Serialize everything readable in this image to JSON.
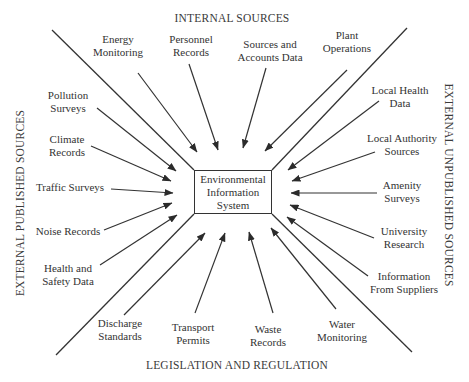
{
  "diagram": {
    "center": {
      "lines": [
        "Environmental",
        "Information",
        "System"
      ],
      "box": {
        "x": 194,
        "y": 170,
        "w": 78,
        "h": 44
      }
    },
    "headings": {
      "top": {
        "text": "INTERNAL SOURCES",
        "x": 232,
        "y": 18
      },
      "bottom": {
        "text": "LEGISLATION AND REGULATION",
        "x": 237,
        "y": 365
      },
      "left": {
        "text": "EXTERNAL PUBLISHED SOURCES",
        "x": 20,
        "y": 203
      },
      "right": {
        "text": "EXTERNAL UNPUBLISHED SOURCES",
        "x": 449,
        "y": 185
      }
    },
    "dividers": [
      {
        "x1": 52,
        "y1": 30,
        "x2": 194,
        "y2": 170
      },
      {
        "x1": 407,
        "y1": 28,
        "x2": 272,
        "y2": 170
      },
      {
        "x1": 194,
        "y1": 214,
        "x2": 56,
        "y2": 355
      },
      {
        "x1": 272,
        "y1": 214,
        "x2": 412,
        "y2": 352
      }
    ],
    "groups": [
      {
        "name": "internal-sources",
        "items": [
          {
            "id": "energy-monitoring",
            "lines": [
              "Energy",
              "Monitoring"
            ],
            "lx": 118,
            "ly": 46,
            "ax1": 138,
            "ay1": 73,
            "ax2": 197,
            "ay2": 152
          },
          {
            "id": "personnel-records",
            "lines": [
              "Personnel",
              "Records"
            ],
            "lx": 191,
            "ly": 46,
            "ax1": 189,
            "ay1": 64,
            "ax2": 218,
            "ay2": 150
          },
          {
            "id": "sources-and-accounts-data",
            "lines": [
              "Sources and",
              "Accounts Data"
            ],
            "lx": 270,
            "ly": 51,
            "ax1": 266,
            "ay1": 68,
            "ax2": 243,
            "ay2": 148
          },
          {
            "id": "plant-operations",
            "lines": [
              "Plant",
              "Operations"
            ],
            "lx": 347,
            "ly": 42,
            "ax1": 347,
            "ay1": 70,
            "ax2": 265,
            "ay2": 151
          }
        ]
      },
      {
        "name": "external-published-sources",
        "items": [
          {
            "id": "pollution-surveys",
            "lines": [
              "Pollution",
              "Surveys"
            ],
            "lx": 68,
            "ly": 102,
            "ax1": 97,
            "ay1": 108,
            "ax2": 176,
            "ay2": 171
          },
          {
            "id": "climate-records",
            "lines": [
              "Climate",
              "Records"
            ],
            "lx": 67,
            "ly": 146,
            "ax1": 91,
            "ay1": 146,
            "ax2": 171,
            "ay2": 181
          },
          {
            "id": "traffic-surveys",
            "lines": [
              "Traffic Surveys"
            ],
            "lx": 70,
            "ly": 187,
            "ax1": 111,
            "ay1": 189,
            "ax2": 173,
            "ay2": 193
          },
          {
            "id": "noise-records",
            "lines": [
              "Noise Records"
            ],
            "lx": 68,
            "ly": 231,
            "ax1": 104,
            "ay1": 230,
            "ax2": 172,
            "ay2": 203
          },
          {
            "id": "health-and-safety-data",
            "lines": [
              "Health and",
              "Safety Data"
            ],
            "lx": 68,
            "ly": 275,
            "ax1": 100,
            "ay1": 265,
            "ax2": 177,
            "ay2": 215
          }
        ]
      },
      {
        "name": "external-unpublished-sources",
        "items": [
          {
            "id": "local-health-data",
            "lines": [
              "Local Health",
              "Data"
            ],
            "lx": 400,
            "ly": 97,
            "ax1": 379,
            "ay1": 101,
            "ax2": 288,
            "ay2": 170
          },
          {
            "id": "local-authority-sources",
            "lines": [
              "Local Authority",
              "Sources"
            ],
            "lx": 402,
            "ly": 145,
            "ax1": 375,
            "ay1": 152,
            "ax2": 292,
            "ay2": 181
          },
          {
            "id": "amenity-surveys",
            "lines": [
              "Amenity",
              "Surveys"
            ],
            "lx": 402,
            "ly": 192,
            "ax1": 377,
            "ay1": 193,
            "ax2": 291,
            "ay2": 193
          },
          {
            "id": "university-research",
            "lines": [
              "University",
              "Research"
            ],
            "lx": 404,
            "ly": 238,
            "ax1": 374,
            "ay1": 238,
            "ax2": 290,
            "ay2": 205
          },
          {
            "id": "information-from-suppliers",
            "lines": [
              "Information",
              "From Suppliers"
            ],
            "lx": 404,
            "ly": 283,
            "ax1": 368,
            "ay1": 276,
            "ax2": 287,
            "ay2": 217
          }
        ]
      },
      {
        "name": "legislation-and-regulation",
        "items": [
          {
            "id": "discharge-standards",
            "lines": [
              "Discharge",
              "Standards"
            ],
            "lx": 120,
            "ly": 330,
            "ax1": 124,
            "ay1": 315,
            "ax2": 205,
            "ay2": 233
          },
          {
            "id": "transport-permits",
            "lines": [
              "Transport",
              "Permits"
            ],
            "lx": 193,
            "ly": 334,
            "ax1": 195,
            "ay1": 313,
            "ax2": 225,
            "ay2": 233
          },
          {
            "id": "waste-records",
            "lines": [
              "Waste",
              "Records"
            ],
            "lx": 268,
            "ly": 336,
            "ax1": 273,
            "ay1": 313,
            "ax2": 249,
            "ay2": 232
          },
          {
            "id": "water-monitoring",
            "lines": [
              "Water",
              "Monitoring"
            ],
            "lx": 342,
            "ly": 331,
            "ax1": 336,
            "ay1": 309,
            "ax2": 271,
            "ay2": 228
          }
        ]
      }
    ],
    "colors": {
      "line": "#333333",
      "text": "#333333",
      "background": "#ffffff"
    }
  }
}
